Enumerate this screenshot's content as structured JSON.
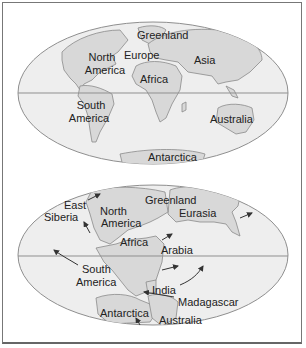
{
  "colors": {
    "ocean": "#eeeeee",
    "land": "#d8d8d8",
    "coast": "#8a8a8a",
    "equator": "#8f8f8f",
    "border": "#777777",
    "text": "#222222",
    "arrow": "#333333"
  },
  "top_map": {
    "description": "Present-day continents",
    "labels": {
      "greenland": "Greenland",
      "north_america_1": "North",
      "north_america_2": "America",
      "europe": "Europe",
      "asia": "Asia",
      "africa": "Africa",
      "south_america_1": "South",
      "south_america_2": "America",
      "australia": "Australia",
      "antarctica": "Antarctica"
    }
  },
  "bottom_map": {
    "description": "Continents in earlier configuration with drift arrows",
    "labels": {
      "east_siberia_1": "East",
      "east_siberia_2": "Siberia",
      "north_america_1": "North",
      "north_america_2": "America",
      "greenland": "Greenland",
      "eurasia": "Eurasia",
      "africa": "Africa",
      "arabia": "Arabia",
      "south_america_1": "South",
      "south_america_2": "America",
      "india": "India",
      "madagascar": "Madagascar",
      "antarctica": "Antarctica",
      "australia": "Australia"
    }
  }
}
